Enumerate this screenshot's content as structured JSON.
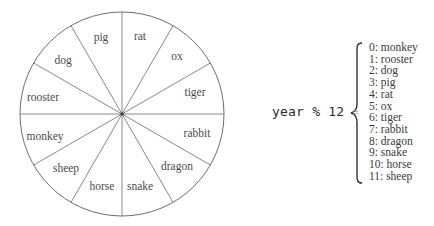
{
  "diagram": {
    "type": "zodiac-wheel-with-modulo-mapping",
    "wheel": {
      "sectors": [
        {
          "label": "rat",
          "x": 140,
          "y": 36
        },
        {
          "label": "ox",
          "x": 177,
          "y": 56
        },
        {
          "label": "tiger",
          "x": 195,
          "y": 92
        },
        {
          "label": "rabbit",
          "x": 197,
          "y": 133
        },
        {
          "label": "dragon",
          "x": 177,
          "y": 166
        },
        {
          "label": "snake",
          "x": 140,
          "y": 186
        },
        {
          "label": "horse",
          "x": 102,
          "y": 186
        },
        {
          "label": "sheep",
          "x": 66,
          "y": 168
        },
        {
          "label": "monkey",
          "x": 45,
          "y": 136
        },
        {
          "label": "rooster",
          "x": 43,
          "y": 97
        },
        {
          "label": "dog",
          "x": 63,
          "y": 60
        },
        {
          "label": "pig",
          "x": 101,
          "y": 37
        }
      ]
    },
    "formula": {
      "expression": "year % 12",
      "equals": "="
    },
    "mapping": [
      "0: monkey",
      "1: rooster",
      "2: dog",
      "3: pig",
      "4: rat",
      "5: ox",
      "6: tiger",
      "7: rabbit",
      "8: dragon",
      "9: snake",
      "10: horse",
      "11: sheep"
    ]
  },
  "colors": {
    "line": "#6e6e6e",
    "text": "#4a4a4a",
    "background": "#ffffff"
  }
}
